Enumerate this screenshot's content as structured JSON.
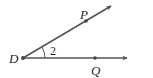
{
  "diagram": {
    "type": "angle",
    "vertex": {
      "label": "D"
    },
    "rays": [
      {
        "name": "ray-DP",
        "point_label": "P",
        "direction": "upper-right"
      },
      {
        "name": "ray-DQ",
        "point_label": "Q",
        "direction": "right"
      }
    ],
    "angle_label": "2",
    "colors": {
      "line": "#555555",
      "point": "#444444",
      "text": "#2a2a2a"
    }
  }
}
